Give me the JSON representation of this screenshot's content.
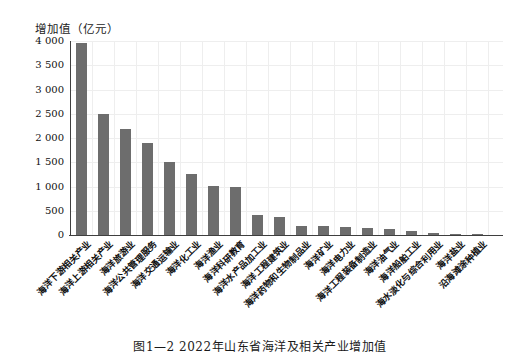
{
  "caption": "图1—2 2022年山东省海洋及相关产业增加值",
  "chart_data": {
    "type": "bar",
    "title": "图1—2 2022年山东省海洋及相关产业增加值",
    "ylabel": "增加值（亿元）",
    "xlabel": "",
    "ylim": [
      0,
      4000
    ],
    "y_tick_step": 500,
    "y_tick_labels": [
      "0",
      "500",
      "1 000",
      "1 500",
      "2 000",
      "2 500",
      "3 000",
      "3 500",
      "4 000"
    ],
    "grid": "on",
    "legend": "none",
    "bar_color": "#6d6d6d",
    "axis_color": "#3f3f3f",
    "grid_color": "#eeeeee",
    "categories": [
      "海洋下游相关产业",
      "海洋上游相关产业",
      "海洋旅游业",
      "海洋公共管理服务",
      "海洋交通运输业",
      "海洋化工业",
      "海洋渔业",
      "海洋科研教育",
      "海洋水产品加工业",
      "海洋工程建筑业",
      "海洋药物和生物制品业",
      "海洋矿业",
      "海洋电力业",
      "海洋工程装备制造业",
      "海洋油气业",
      "海洋船舶工业",
      "海水淡化与综合利用业",
      "海洋盐业",
      "沿海滩涂种植业"
    ],
    "values": [
      3950,
      2500,
      2190,
      1900,
      1510,
      1250,
      1010,
      990,
      410,
      380,
      190,
      185,
      155,
      140,
      120,
      80,
      45,
      15,
      5
    ]
  }
}
